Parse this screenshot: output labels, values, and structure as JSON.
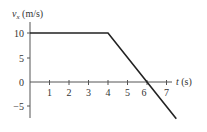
{
  "chart_data": {
    "type": "line",
    "title": "",
    "xlabel": "t (s)",
    "ylabel": "vx (m/s)",
    "ylabel_main": "v",
    "ylabel_sub": "x",
    "ylabel_units": " (m/s)",
    "xlabel_var": "t",
    "xlabel_units": " (s)",
    "x_ticks": [
      "1",
      "2",
      "3",
      "4",
      "5",
      "6",
      "7"
    ],
    "y_ticks": [
      "10",
      "5",
      "0",
      "−5"
    ],
    "xlim": [
      0,
      7.5
    ],
    "ylim": [
      -7.5,
      10
    ],
    "grid": false,
    "series": [
      {
        "name": "vx",
        "x": [
          0,
          4,
          6,
          7.5
        ],
        "values": [
          10,
          10,
          0,
          -7.5
        ]
      }
    ]
  }
}
